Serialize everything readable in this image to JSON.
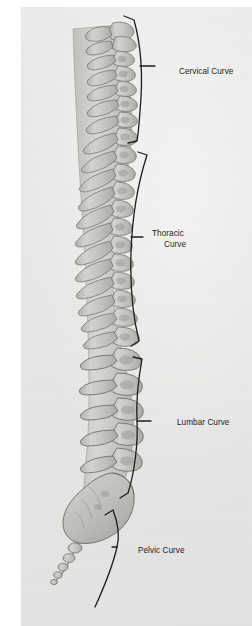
{
  "figure": {
    "kind": "anatomical-illustration",
    "background_color": "#e7e7e5",
    "paper_margin_color": "#ffffff",
    "ink_color": "#1d1d1d",
    "bone_color": "#cfcfcb"
  },
  "labels": {
    "cervical": "Cervical Curve",
    "thoracic_line1": "Thoracic",
    "thoracic_line2": "Curve",
    "lumbar": "Lumbar Curve",
    "pelvic": "Pelvic Curve"
  },
  "regions": [
    {
      "name": "cervical",
      "label": "Cervical Curve",
      "vertebrae": 7
    },
    {
      "name": "thoracic",
      "label": "Thoracic Curve",
      "vertebrae": 12
    },
    {
      "name": "lumbar",
      "label": "Lumbar Curve",
      "vertebrae": 5
    },
    {
      "name": "pelvic",
      "label": "Pelvic Curve",
      "vertebrae": 9
    }
  ]
}
